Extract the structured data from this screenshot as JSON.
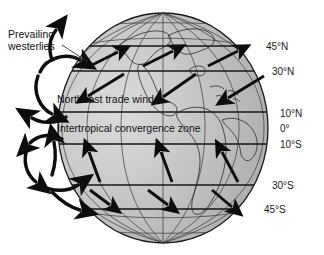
{
  "figure": {
    "background_color": "#ffffff",
    "globe": {
      "center_x": 163,
      "center_y": 128,
      "radius_x": 105,
      "radius_y": 115,
      "fill_color": "#b9b9b9",
      "outline_color": "#1a1a1a",
      "graticule_color": "#2b2b2b"
    }
  },
  "latitude_labels": [
    {
      "id": "lat-45n",
      "text": "45°N",
      "x": 266,
      "y": 41
    },
    {
      "id": "lat-30n",
      "text": "30°N",
      "x": 272,
      "y": 66
    },
    {
      "id": "lat-10n",
      "text": "10°N",
      "x": 280,
      "y": 108
    },
    {
      "id": "lat-0",
      "text": "0°",
      "x": 280,
      "y": 123
    },
    {
      "id": "lat-10s",
      "text": "10°S",
      "x": 280,
      "y": 139
    },
    {
      "id": "lat-30s",
      "text": "30°S",
      "x": 272,
      "y": 180
    },
    {
      "id": "lat-45s",
      "text": "45°S",
      "x": 264,
      "y": 204
    }
  ],
  "annotations": {
    "prevailing_westerlies": {
      "line1": "Prevailing",
      "line2": "westerlies",
      "x": 8,
      "y": 28
    },
    "northeast_trade_winds": {
      "text": "Northeast trade winds",
      "x": 57,
      "y": 93
    },
    "intertropical_convergence_zone": {
      "text": "Intertropical convergence zone",
      "x": 57,
      "y": 122
    }
  },
  "wind_bands": [
    {
      "name": "northern-prevailing-westerlies",
      "latitude_range": "30°N-45°N",
      "arrow_direction": "northeast",
      "arrow_count": 3
    },
    {
      "name": "northeast-trade-winds",
      "latitude_range": "10°N-30°N",
      "arrow_direction": "southwest",
      "arrow_count": 3
    },
    {
      "name": "southeast-trade-winds",
      "latitude_range": "10°S-30°S",
      "arrow_direction": "northeast",
      "arrow_count": 3
    },
    {
      "name": "southern-prevailing-westerlies",
      "latitude_range": "30°S-45°S",
      "arrow_direction": "southeast",
      "arrow_count": 3
    }
  ],
  "circulation_cells": [
    {
      "name": "northern-ferrel-cell",
      "position": "upper-left",
      "rotation": "clockwise"
    },
    {
      "name": "northern-hadley-cell",
      "position": "mid-left",
      "rotation": "counterclockwise"
    },
    {
      "name": "southern-hadley-cell",
      "position": "lower-left",
      "rotation": "clockwise"
    }
  ]
}
